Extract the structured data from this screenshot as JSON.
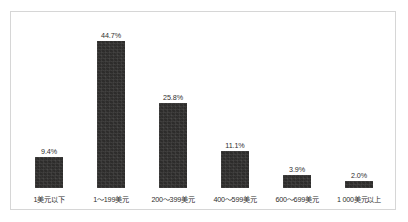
{
  "chart_data": {
    "type": "bar",
    "title": "",
    "subtitle": "",
    "xlabel": "",
    "ylabel": "",
    "grid": false,
    "legend": "none",
    "ylim": [
      0,
      50
    ],
    "categories": [
      "1美元以下",
      "1～199美元",
      "200～399美元",
      "400～599美元",
      "600～699美元",
      "1 000美元以上"
    ],
    "values": [
      9.4,
      44.7,
      25.8,
      11.1,
      3.9,
      2.0
    ],
    "data_labels": [
      "9.4%",
      "44.7%",
      "25.8%",
      "11.1%",
      "3.9%",
      "2.0%"
    ],
    "series": [
      {
        "name": "",
        "values": [
          9.4,
          44.7,
          25.8,
          11.1,
          3.9,
          2.0
        ]
      }
    ],
    "colors": {
      "bar": "#2d2c2b",
      "frame_border": "#d6d6d6",
      "background": "#ffffff",
      "text": "#2e2e2e"
    }
  }
}
